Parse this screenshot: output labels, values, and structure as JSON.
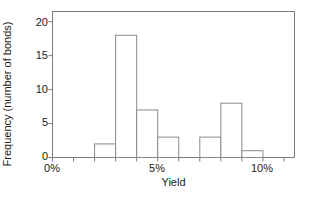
{
  "chart_data": {
    "type": "bar",
    "title": "",
    "xlabel": "Yield",
    "ylabel": "Frequency (number of bonds)",
    "xlim": [
      0,
      11.5
    ],
    "ylim": [
      0,
      21.5
    ],
    "grid": false,
    "legend": null,
    "bin_width": 1,
    "bin_unit": "%",
    "x_tick_labels": [
      "0%",
      "5%",
      "10%"
    ],
    "x_tick_values": [
      0,
      5,
      10
    ],
    "x_minor_tick_values": [
      0,
      1,
      2,
      3,
      4,
      5,
      6,
      7,
      8,
      9,
      10,
      11
    ],
    "y_tick_labels": [
      "0",
      "5",
      "10",
      "15",
      "20"
    ],
    "y_tick_values": [
      0,
      5,
      10,
      15,
      20
    ],
    "bin_edges": [
      2,
      3,
      4,
      5,
      6,
      7,
      8,
      9,
      10
    ],
    "categories": [
      "2%-3%",
      "3%-4%",
      "4%-5%",
      "5%-6%",
      "6%-7%",
      "7%-8%",
      "8%-9%",
      "9%-10%"
    ],
    "values": [
      2,
      18,
      7,
      3,
      0,
      3,
      8,
      1
    ],
    "bars": [
      {
        "x0": 2,
        "x1": 3,
        "height": 2
      },
      {
        "x0": 3,
        "x1": 4,
        "height": 18
      },
      {
        "x0": 4,
        "x1": 5,
        "height": 7
      },
      {
        "x0": 5,
        "x1": 6,
        "height": 3
      },
      {
        "x0": 6,
        "x1": 7,
        "height": 0
      },
      {
        "x0": 7,
        "x1": 8,
        "height": 3
      },
      {
        "x0": 8,
        "x1": 9,
        "height": 8
      },
      {
        "x0": 9,
        "x1": 10,
        "height": 1
      }
    ],
    "total_count": 42,
    "bar_fill_color": "#ffffff",
    "bar_edge_color": "#8a8a8a",
    "axis_color": "#7a7a7a",
    "text_color": "#1a1a1a",
    "background_color": "#ffffff"
  }
}
